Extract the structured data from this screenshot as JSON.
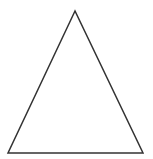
{
  "diagram": {
    "shape": "triangle",
    "type": "isosceles",
    "vertices": {
      "apex": [
        75,
        11
      ],
      "bottom_left": [
        8,
        153
      ],
      "bottom_right": [
        143,
        153
      ]
    },
    "stroke_color": "#333333",
    "stroke_width": 1.5,
    "fill_color": "#ffffff",
    "background": "#ffffff"
  }
}
